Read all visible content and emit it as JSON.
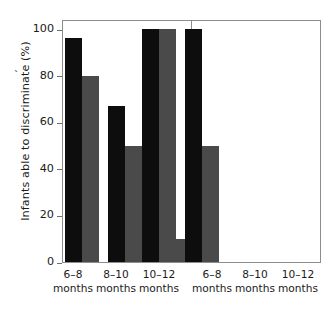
{
  "chart_data": {
    "type": "bar",
    "title": "",
    "subtitle": "",
    "xlabel": "",
    "ylabel": "Infants able to discriminate (%)",
    "ylim": [
      0,
      100
    ],
    "yticks": [
      0,
      20,
      40,
      60,
      80,
      100
    ],
    "ytick_labels": [
      "0",
      "20",
      "40",
      "60",
      "80",
      "100"
    ],
    "grid": false,
    "legend": null,
    "legend_position": "none",
    "panels": [
      {
        "name": "left-panel",
        "categories": [
          "6–18 months",
          "8–10 months",
          "10–12 months"
        ],
        "category_lines": [
          [
            "6–8",
            "months"
          ],
          [
            "8–10",
            "months"
          ],
          [
            "10–12",
            "months"
          ]
        ],
        "series": [
          {
            "name": "dark",
            "color": "#0d0d0d",
            "values": [
              96,
              67,
              20
            ]
          },
          {
            "name": "light",
            "color": "#4a4a4a",
            "values": [
              80,
              50,
              10
            ]
          }
        ]
      },
      {
        "name": "right-panel",
        "categories": [
          "6–8 months",
          "8–10 months",
          "10–12 months"
        ],
        "category_lines": [
          [
            "6–8",
            "months"
          ],
          [
            "8–10",
            "months"
          ],
          [
            "10–12",
            "months"
          ]
        ],
        "series": [
          {
            "name": "dark",
            "color": "#0d0d0d",
            "values": [
              100,
              100,
              null
            ]
          },
          {
            "name": "light",
            "color": "#4a4a4a",
            "values": [
              100,
              50,
              null
            ]
          }
        ]
      }
    ]
  },
  "axis": {
    "tick_labels": [
      "100",
      "80",
      "60",
      "40",
      "20",
      "0"
    ],
    "y_title": "Infants able to discriminate (%)"
  },
  "xlabels": {
    "left": [
      {
        "top": "6–8",
        "bottom": "months"
      },
      {
        "top": "8–10",
        "bottom": "months"
      },
      {
        "top": "10–12",
        "bottom": "months"
      }
    ],
    "right": [
      {
        "top": "6–8",
        "bottom": "months"
      },
      {
        "top": "8–10",
        "bottom": "months"
      },
      {
        "top": "10–12",
        "bottom": "months"
      }
    ]
  },
  "colors": {
    "dark_series": "#0d0d0d",
    "light_series": "#4a4a4a",
    "frame": "#8d8d8d",
    "text": "#1b1b1b",
    "background": "#ffffff"
  }
}
